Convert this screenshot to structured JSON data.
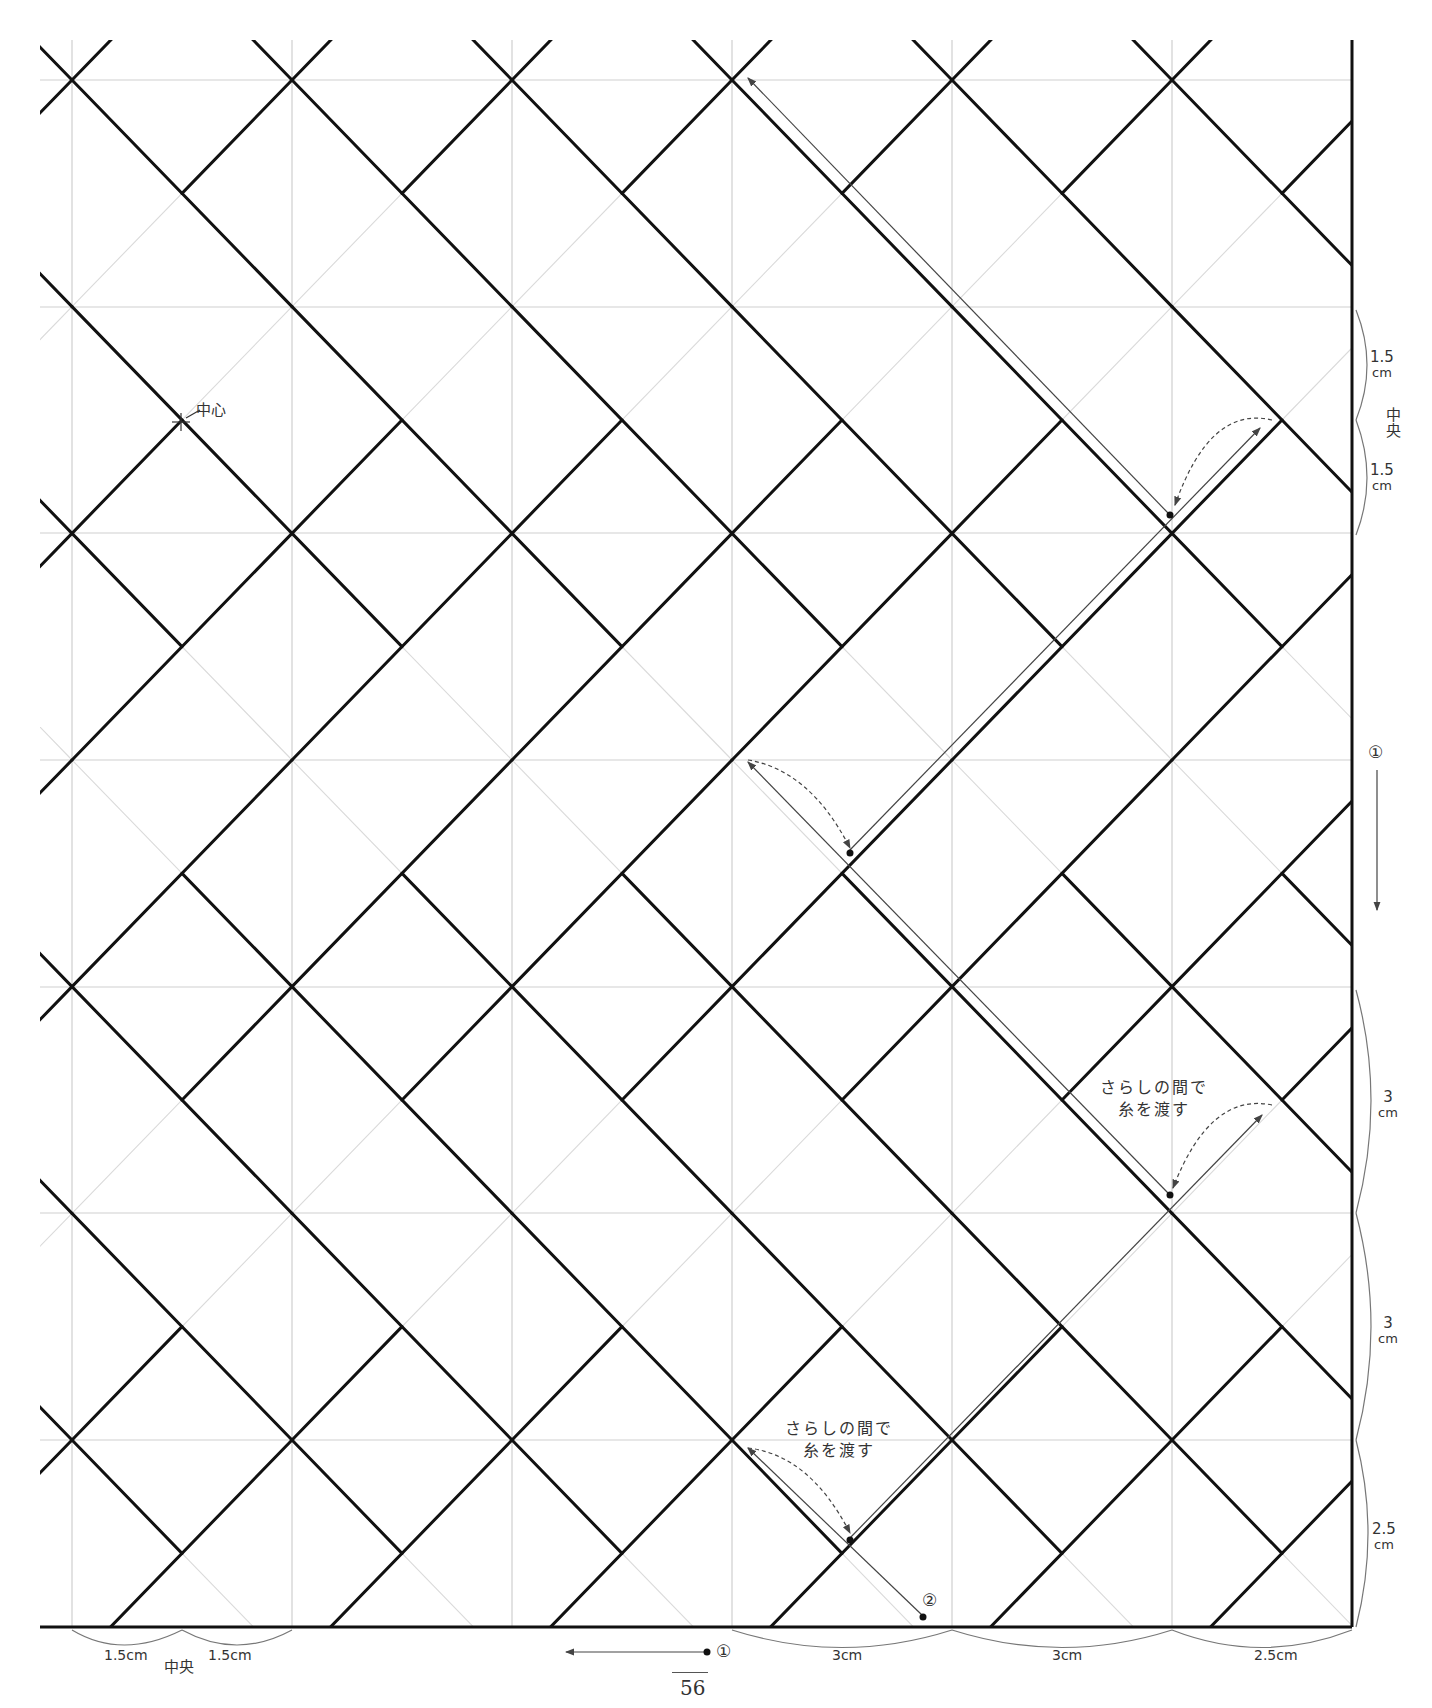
{
  "diagram": {
    "colors": {
      "stitch": "#111111",
      "grid": "#c8c8c8",
      "guide": "#d6d6d6",
      "annotation": "#555555"
    },
    "grid": {
      "x": [
        72,
        292,
        512,
        732,
        952,
        1172
      ],
      "y": [
        80,
        307,
        533,
        760,
        987,
        1213,
        1440
      ],
      "left": 40,
      "right": 1352,
      "top": 40,
      "bottom": 1627
    },
    "labels": {
      "center": "中心",
      "middle_right": "中央",
      "middle_bottom": "中央",
      "dim_right": [
        {
          "value": "1.5",
          "unit": "cm"
        },
        {
          "value": "1.5",
          "unit": "cm"
        },
        {
          "value": "3",
          "unit": "cm"
        },
        {
          "value": "3",
          "unit": "cm"
        },
        {
          "value": "2.5",
          "unit": "cm"
        }
      ],
      "dim_bottom": [
        "1.5cm",
        "1.5cm",
        "3cm",
        "3cm",
        "2.5cm"
      ],
      "step1": "①",
      "step2": "②",
      "note1_line1": "さらしの間で",
      "note1_line2": "糸を渡す",
      "note2_line1": "さらしの間で",
      "note2_line2": "糸を渡す",
      "page_number": "56"
    }
  }
}
